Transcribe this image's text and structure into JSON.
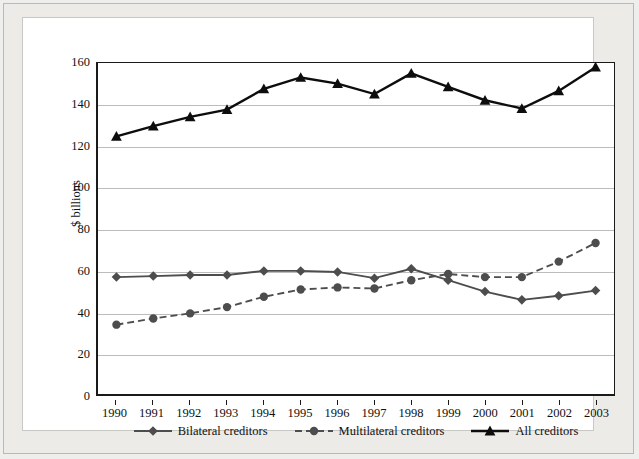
{
  "chart_data": {
    "type": "line",
    "title": "",
    "subtitle": "",
    "xlabel": "",
    "ylabel": "$ billions",
    "grid": true,
    "legend_position": "bottom",
    "xlim": [
      1990,
      2003
    ],
    "ylim": [
      0,
      160
    ],
    "ytick_step": 20,
    "categories": [
      "1990",
      "1991",
      "1992",
      "1993",
      "1994",
      "1995",
      "1996",
      "1997",
      "1998",
      "1999",
      "2000",
      "2001",
      "2002",
      "2003"
    ],
    "yticks": [
      "0",
      "20",
      "40",
      "60",
      "80",
      "100",
      "120",
      "140",
      "160"
    ],
    "series": [
      {
        "name": "Bilateral creditors",
        "marker": "diamond",
        "line_style": "solid",
        "color": "#4d4d4d",
        "values": [
          56.5,
          57,
          57.5,
          57.5,
          59.5,
          59.5,
          59,
          56,
          60.5,
          55,
          49.5,
          45.5,
          47.5,
          50
        ]
      },
      {
        "name": "Multilateral creditors",
        "marker": "circle",
        "line_style": "dashed",
        "color": "#4d4d4d",
        "values": [
          33.5,
          36.5,
          39,
          42,
          47,
          50.5,
          51.5,
          51,
          55,
          58,
          56.5,
          56.5,
          64,
          73
        ]
      },
      {
        "name": "All creditors",
        "marker": "triangle",
        "line_style": "solid",
        "color": "#0d0d0d",
        "values": [
          124.5,
          129.5,
          134,
          137.5,
          147.5,
          153,
          150,
          145,
          155,
          148.5,
          142,
          138,
          146.5,
          158
        ]
      }
    ]
  },
  "legend": {
    "items": [
      {
        "label": "Bilateral creditors"
      },
      {
        "label": "Multilateral creditors"
      },
      {
        "label": "All creditors"
      }
    ]
  },
  "axis": {
    "y_title": "$ billions"
  }
}
